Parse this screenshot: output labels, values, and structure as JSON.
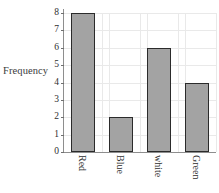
{
  "chart_data": {
    "type": "bar",
    "title": "",
    "subtitle": "",
    "xlabel": "",
    "ylabel": "Frequency",
    "categories": [
      "Red",
      "Blue",
      "white",
      "Green"
    ],
    "values": [
      8,
      2,
      6,
      4
    ],
    "ylim": [
      0,
      8
    ],
    "yticks": [
      0,
      1,
      2,
      3,
      4,
      5,
      6,
      7,
      8
    ],
    "ytick_labels": [
      "0",
      "1",
      "2",
      "3",
      "4",
      "5",
      "6",
      "7",
      "8"
    ],
    "grid": true,
    "grid_orientation": "both",
    "legend": null,
    "legend_position": "none",
    "annotations": [],
    "bar_fill_color": "#a3a3a3",
    "bar_edge_color": "#2b2b2b",
    "grid_color": "#e9e9e9",
    "axis_color": "#8e8e8e",
    "text_color": "#2e2e2e",
    "background_color": "#ffffff",
    "xtick_label_rotation": 90
  }
}
